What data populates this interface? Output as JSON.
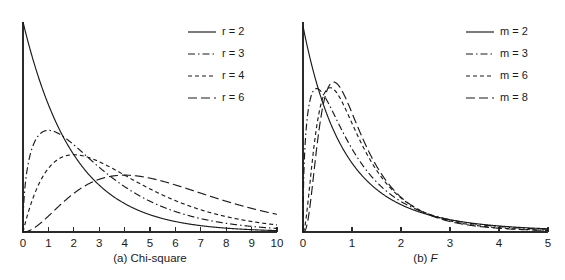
{
  "figure": {
    "name": "chi-square-and-f-distribution-densities",
    "background": "#ffffff",
    "ink_color": "#1a1a1a"
  },
  "chart_data": [
    {
      "type": "line",
      "panel": "a",
      "title": "(a) Chi-square",
      "caption_prefix": "(a) ",
      "caption_name": "Chi-square",
      "caption_italic": "",
      "xlabel": "",
      "ylabel": "",
      "xlim": [
        0,
        10
      ],
      "ylim": [
        0,
        0.5
      ],
      "xticks": [
        0,
        1,
        2,
        3,
        4,
        5,
        6,
        7,
        8,
        9,
        10
      ],
      "xtick_labels": [
        "0",
        "1",
        "2",
        "3",
        "4",
        "5",
        "6",
        "7",
        "8",
        "9",
        "10"
      ],
      "yticks": [],
      "grid": false,
      "legend_position": "top-right",
      "distribution": "chi-square",
      "param_symbol": "r",
      "series": [
        {
          "name": "r = 2",
          "param": 2,
          "dash": "none",
          "dasharray": "",
          "x": [
            0,
            0.5,
            1,
            1.5,
            2,
            2.5,
            3,
            3.5,
            4,
            4.5,
            5,
            6,
            7,
            8,
            9,
            10
          ],
          "values": [
            0.5,
            0.389,
            0.303,
            0.236,
            0.184,
            0.143,
            0.112,
            0.087,
            0.068,
            0.053,
            0.041,
            0.025,
            0.015,
            0.009,
            0.006,
            0.003
          ]
        },
        {
          "name": "r = 3",
          "param": 3,
          "dash": "dash-dot",
          "dasharray": "7,3,1.5,3",
          "x": [
            0,
            0.5,
            1,
            1.5,
            2,
            2.5,
            3,
            3.5,
            4,
            4.5,
            5,
            6,
            7,
            8,
            9,
            10
          ],
          "values": [
            0.0,
            0.22,
            0.242,
            0.232,
            0.207,
            0.18,
            0.154,
            0.129,
            0.108,
            0.089,
            0.073,
            0.049,
            0.032,
            0.021,
            0.013,
            0.0085
          ]
        },
        {
          "name": "r = 4",
          "param": 4,
          "dash": "short-dash",
          "dasharray": "4,3",
          "x": [
            0,
            0.5,
            1,
            1.5,
            2,
            2.5,
            3,
            3.5,
            4,
            4.5,
            5,
            6,
            7,
            8,
            9,
            10
          ],
          "values": [
            0.0,
            0.097,
            0.152,
            0.177,
            0.184,
            0.179,
            0.167,
            0.153,
            0.135,
            0.119,
            0.103,
            0.075,
            0.053,
            0.037,
            0.025,
            0.017
          ]
        },
        {
          "name": "r = 6",
          "param": 6,
          "dash": "long-dash",
          "dasharray": "9,4",
          "x": [
            0,
            0.5,
            1,
            1.5,
            2,
            2.5,
            3,
            3.5,
            4,
            4.5,
            5,
            6,
            7,
            8,
            9,
            10
          ],
          "values": [
            0.0,
            0.0081,
            0.0379,
            0.0663,
            0.092,
            0.1068,
            0.1125,
            0.1128,
            0.1084,
            0.1014,
            0.0921,
            0.0728,
            0.0548,
            0.0397,
            0.0281,
            0.0195
          ]
        }
      ]
    },
    {
      "type": "line",
      "panel": "b",
      "title": "(b) F",
      "caption_prefix": "(b) ",
      "caption_name": "",
      "caption_italic": "F",
      "xlabel": "",
      "ylabel": "",
      "xlim": [
        0,
        5
      ],
      "ylim": [
        0,
        1.0
      ],
      "xticks": [
        0,
        1,
        2,
        3,
        4,
        5
      ],
      "xtick_labels": [
        "0",
        "1",
        "2",
        "3",
        "4",
        "5"
      ],
      "yticks": [],
      "grid": false,
      "legend_position": "top-right",
      "distribution": "F",
      "param_symbol": "m",
      "denominator_df": 10,
      "series": [
        {
          "name": "m = 2",
          "param": 2,
          "dash": "none",
          "dasharray": "",
          "x": [
            0,
            0.25,
            0.5,
            0.75,
            1,
            1.5,
            2,
            2.5,
            3,
            3.5,
            4,
            4.5,
            5
          ],
          "values": [
            1.0,
            0.78,
            0.6,
            0.47,
            0.37,
            0.23,
            0.146,
            0.096,
            0.065,
            0.045,
            0.032,
            0.023,
            0.017
          ]
        },
        {
          "name": "m = 3",
          "param": 3,
          "dash": "dash-dot",
          "dasharray": "7,3,1.5,3",
          "x": [
            0,
            0.25,
            0.5,
            0.75,
            1,
            1.5,
            2,
            2.5,
            3,
            3.5,
            4,
            4.5,
            5
          ],
          "values": [
            0.0,
            0.72,
            0.73,
            0.63,
            0.52,
            0.33,
            0.2,
            0.126,
            0.081,
            0.054,
            0.037,
            0.026,
            0.019
          ]
        },
        {
          "name": "m = 6",
          "param": 6,
          "dash": "short-dash",
          "dasharray": "4,3",
          "x": [
            0,
            0.25,
            0.5,
            0.75,
            1,
            1.5,
            2,
            2.5,
            3,
            3.5,
            4,
            4.5,
            5
          ],
          "values": [
            0.0,
            0.33,
            0.76,
            0.84,
            0.74,
            0.44,
            0.24,
            0.13,
            0.073,
            0.043,
            0.026,
            0.016,
            0.011
          ]
        },
        {
          "name": "m = 8",
          "param": 8,
          "dash": "long-dash",
          "dasharray": "9,4",
          "x": [
            0,
            0.25,
            0.5,
            0.75,
            1,
            1.5,
            2,
            2.5,
            3,
            3.5,
            4,
            4.5,
            5
          ],
          "values": [
            0.0,
            0.19,
            0.72,
            0.9,
            0.8,
            0.46,
            0.23,
            0.115,
            0.059,
            0.032,
            0.018,
            0.011,
            0.0065
          ]
        }
      ]
    }
  ],
  "legends": [
    {
      "panel": "a",
      "entries": [
        {
          "label": "r = 2",
          "dasharray": ""
        },
        {
          "label": "r = 3",
          "dasharray": "7,3,1.5,3"
        },
        {
          "label": "r = 4",
          "dasharray": "4,3"
        },
        {
          "label": "r = 6",
          "dasharray": "9,4"
        }
      ]
    },
    {
      "panel": "b",
      "entries": [
        {
          "label": "m = 2",
          "dasharray": ""
        },
        {
          "label": "m = 3",
          "dasharray": "7,3,1.5,3"
        },
        {
          "label": "m = 6",
          "dasharray": "4,3"
        },
        {
          "label": "m = 8",
          "dasharray": "9,4"
        }
      ]
    }
  ]
}
